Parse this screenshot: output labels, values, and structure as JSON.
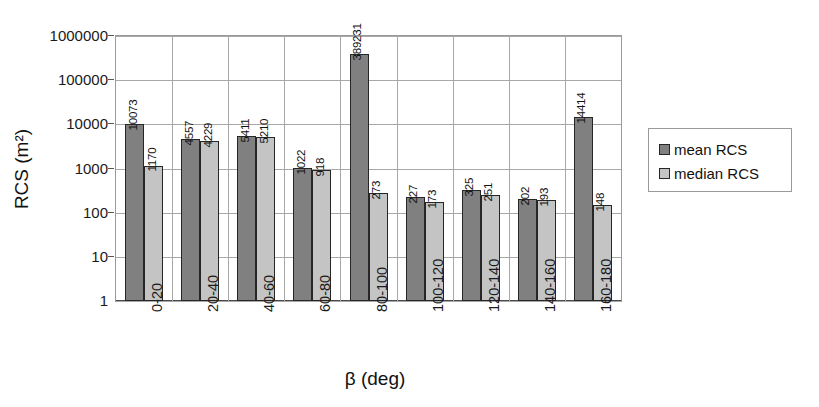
{
  "chart_data": {
    "type": "bar",
    "title": "",
    "xlabel": "β (deg)",
    "ylabel": "RCS (m²)",
    "yscale": "log",
    "ylim": [
      1,
      1000000
    ],
    "yticks": [
      1,
      10,
      100,
      1000,
      10000,
      100000,
      1000000
    ],
    "ytick_labels": [
      "1",
      "10",
      "100",
      "1000",
      "10000",
      "100000",
      "1000000"
    ],
    "grid": "horizontal-and-vertical",
    "legend_position": "right",
    "categories": [
      "0-20",
      "20-40",
      "40-60",
      "60-80",
      "80-100",
      "100-120",
      "120-140",
      "140-160",
      "160-180"
    ],
    "series": [
      {
        "name": "mean RCS",
        "color": "#808080",
        "values": [
          10073,
          4557,
          5411,
          1022,
          389231,
          227,
          325,
          202,
          14414
        ],
        "labels": [
          "10073",
          "4557",
          "5411",
          "1022",
          "389231",
          "227",
          "325",
          "202",
          "14414"
        ]
      },
      {
        "name": "median RCS",
        "color": "#c4c4c4",
        "values": [
          1170,
          4229,
          5210,
          918,
          273,
          173,
          251,
          193,
          148
        ],
        "labels": [
          "1170",
          "4229",
          "5210",
          "918",
          "273",
          "173",
          "251",
          "193",
          "148"
        ]
      }
    ]
  },
  "legend": {
    "items": [
      {
        "label": "mean RCS",
        "color": "#808080"
      },
      {
        "label": "median RCS",
        "color": "#c4c4c4"
      }
    ]
  },
  "axes": {
    "x_title": "β (deg)",
    "y_title": "RCS (m²)"
  }
}
